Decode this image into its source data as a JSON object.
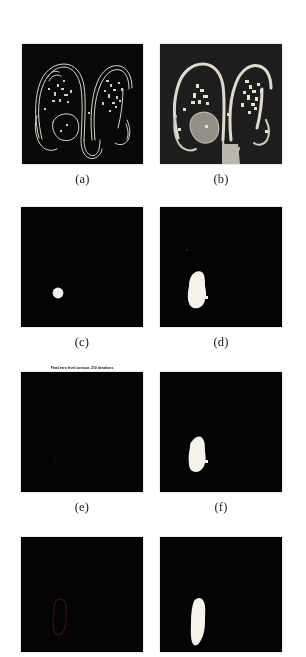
{
  "figure": {
    "kind": "multi-panel-figure",
    "background_color": "#fefefe",
    "panel_background": "#040404",
    "panel_b_background": "#191919",
    "contour_color": "#e8e4d8",
    "blob_color": "#f5f3ec",
    "gray_region_color": "#8f8d84",
    "faint_contour_color": "#3a1210",
    "columns": 2,
    "rows": 4
  },
  "panels": [
    {
      "id": "a",
      "caption": "(a)",
      "type": "mri-with-contours",
      "title": "",
      "x": 22,
      "y": 44,
      "w": 121,
      "h": 120,
      "description": "dark MRI slice with thin light contour outlines"
    },
    {
      "id": "b",
      "caption": "(b)",
      "type": "mri-segmented",
      "title": "",
      "x": 160,
      "y": 44,
      "w": 122,
      "h": 120,
      "description": "MRI slice with thick bright segmentation and gray filled region"
    },
    {
      "id": "c",
      "caption": "(c)",
      "type": "binary-mask",
      "title": "",
      "x": 21,
      "y": 207,
      "w": 122,
      "h": 120,
      "description": "black field with small round white initialization blob"
    },
    {
      "id": "d",
      "caption": "(d)",
      "type": "binary-mask",
      "title": "",
      "x": 160,
      "y": 207,
      "w": 122,
      "h": 120,
      "description": "black field with irregular elongated white blob"
    },
    {
      "id": "e",
      "caption": "(e)",
      "type": "binary-mask",
      "title": "Final zero level contour, 210 iterations",
      "x": 21,
      "y": 372,
      "w": 122,
      "h": 120,
      "description": "nearly all black field"
    },
    {
      "id": "f",
      "caption": "(f)",
      "type": "binary-mask",
      "title": "",
      "x": 160,
      "y": 372,
      "w": 122,
      "h": 120,
      "description": "black field with irregular white blob"
    },
    {
      "id": "g",
      "caption": "",
      "type": "binary-mask",
      "title": "",
      "x": 21,
      "y": 537,
      "w": 122,
      "h": 115,
      "description": "black field with faint dark red contour outline"
    },
    {
      "id": "h",
      "caption": "",
      "type": "binary-mask",
      "title": "",
      "x": 160,
      "y": 537,
      "w": 122,
      "h": 115,
      "description": "black field with white elongated blob"
    }
  ],
  "captions": {
    "a": "(a)",
    "b": "(b)",
    "c": "(c)",
    "d": "(d)",
    "e": "(e)",
    "f": "(f)"
  },
  "titles": {
    "e": "Final zero level contour, 210 iterations"
  },
  "shapes": {
    "c_blob": {
      "cx": 58,
      "cy": 293,
      "r": 5.2
    },
    "d_blob": {
      "cx": 196,
      "cy": 292,
      "rx": 8,
      "ry": 18
    },
    "f_blob": {
      "cx": 196,
      "cy": 455,
      "rx": 7,
      "ry": 17
    },
    "g_contour": {
      "cx": 58,
      "cy": 620,
      "rx": 7,
      "ry": 16
    },
    "h_blob": {
      "cx": 197,
      "cy": 623,
      "rx": 7,
      "ry": 17
    }
  }
}
